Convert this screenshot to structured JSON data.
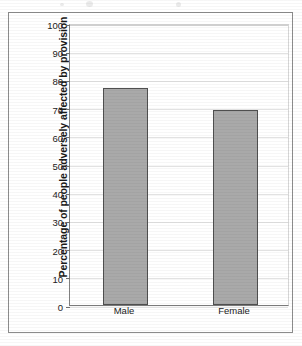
{
  "chart_data": {
    "type": "bar",
    "title": "",
    "subtitle": "",
    "xlabel": "",
    "ylabel": "Percentage of people adversely affected by provision",
    "categories": [
      "Male",
      "Female"
    ],
    "values": [
      77,
      69
    ],
    "ylim": [
      0,
      100
    ],
    "ytick_step": 10,
    "yticks": [
      0,
      10,
      20,
      30,
      40,
      50,
      60,
      70,
      80,
      90,
      100
    ],
    "ytick_labels": [
      "0",
      "10",
      "20",
      "30",
      "40",
      "50",
      "60",
      "70",
      "80",
      "90",
      "100"
    ],
    "grid": true,
    "grid_axis": "y",
    "legend": false,
    "legend_position": "none",
    "annotations": [],
    "series": [
      {
        "name": "Percentage adversely affected",
        "values": [
          77,
          69
        ]
      }
    ]
  },
  "style": {
    "bar_fill": "#a9a9a9",
    "bar_border": "#4f4f4f",
    "gridline_color": "#e2e2e2",
    "axis_color": "#7a7a7a",
    "frame_border": "#8c8c8c",
    "plot_background": "#ffffff",
    "page_background": "#ffffff",
    "text_color": "#222222"
  }
}
